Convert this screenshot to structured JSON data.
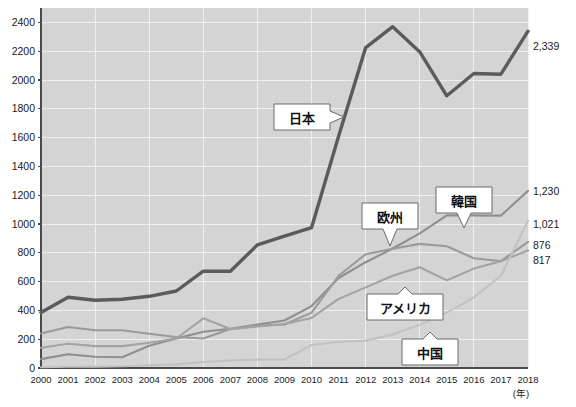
{
  "chart_data": {
    "type": "line",
    "title": "",
    "xlabel": "(年)",
    "ylabel": "",
    "ylim": [
      0,
      2500
    ],
    "xlim": [
      2000,
      2018
    ],
    "grid": true,
    "legend_position": "inline-callouts",
    "categories": [
      "2000",
      "2001",
      "2002",
      "2003",
      "2004",
      "2005",
      "2006",
      "2007",
      "2008",
      "2009",
      "2010",
      "2011",
      "2012",
      "2013",
      "2014",
      "2015",
      "2016",
      "2017",
      "2018"
    ],
    "yticks": [
      "0",
      "200",
      "400",
      "600",
      "800",
      "1000",
      "1200",
      "1400",
      "1600",
      "1800",
      "2000",
      "2200",
      "2400"
    ],
    "ytick_values": [
      0,
      200,
      400,
      600,
      800,
      1000,
      1200,
      1400,
      1600,
      1800,
      2000,
      2200,
      2400
    ],
    "series": [
      {
        "name": "日本",
        "color": "#5b5b5b",
        "width": 3.4,
        "end_value": "2,339",
        "values": [
          385,
          492,
          470,
          478,
          498,
          535,
          672,
          672,
          855,
          915,
          975,
          1610,
          2225,
          2370,
          2195,
          1890,
          2045,
          2040,
          2339
        ]
      },
      {
        "name": "韓国",
        "color": "#8f8f8f",
        "width": 2.1,
        "end_value": "1,230",
        "values": [
          62,
          95,
          78,
          75,
          155,
          205,
          252,
          272,
          302,
          330,
          430,
          625,
          735,
          830,
          935,
          1060,
          1060,
          1058,
          1230
        ]
      },
      {
        "name": "欧州",
        "color": "#9a9a9a",
        "width": 2.1,
        "end_value": "876",
        "values": [
          240,
          285,
          262,
          262,
          238,
          215,
          205,
          270,
          295,
          302,
          385,
          640,
          790,
          828,
          862,
          845,
          762,
          742,
          876
        ]
      },
      {
        "name": "アメリカ",
        "color": "#a3a3a3",
        "width": 2.1,
        "end_value": "817",
        "values": [
          140,
          168,
          152,
          152,
          175,
          205,
          345,
          270,
          288,
          305,
          348,
          480,
          560,
          640,
          700,
          608,
          690,
          742,
          817
        ]
      },
      {
        "name": "中国",
        "color": "#c2c2c2",
        "width": 2.1,
        "end_value": "1,021",
        "values": [
          5,
          8,
          10,
          12,
          18,
          25,
          42,
          52,
          58,
          60,
          160,
          182,
          190,
          232,
          300,
          385,
          490,
          640,
          1021
        ]
      }
    ],
    "callouts": [
      {
        "label": "日本",
        "x": 302,
        "y": 117,
        "w": 56,
        "h": 26,
        "tail": "right",
        "tail_x": 348,
        "tail_y": 117
      },
      {
        "label": "欧州",
        "x": 390,
        "y": 216,
        "w": 56,
        "h": 26,
        "tail": "down",
        "tail_x": 390,
        "tail_y": 246
      },
      {
        "label": "韓国",
        "x": 464,
        "y": 200,
        "w": 56,
        "h": 26,
        "tail": "down",
        "tail_x": 464,
        "tail_y": 228
      },
      {
        "label": "アメリカ",
        "x": 405,
        "y": 307,
        "w": 76,
        "h": 26,
        "tail": "up",
        "tail_x": 405,
        "tail_y": 287
      },
      {
        "label": "中国",
        "x": 430,
        "y": 352,
        "w": 56,
        "h": 26,
        "tail": "up",
        "tail_x": 430,
        "tail_y": 332
      }
    ],
    "end_labels": [
      {
        "text": "2,339",
        "y": 50
      },
      {
        "text": "1,230",
        "y": 195
      },
      {
        "text": "1,021",
        "y": 228
      },
      {
        "text": "876",
        "y": 249
      },
      {
        "text": "817",
        "y": 264
      }
    ]
  }
}
